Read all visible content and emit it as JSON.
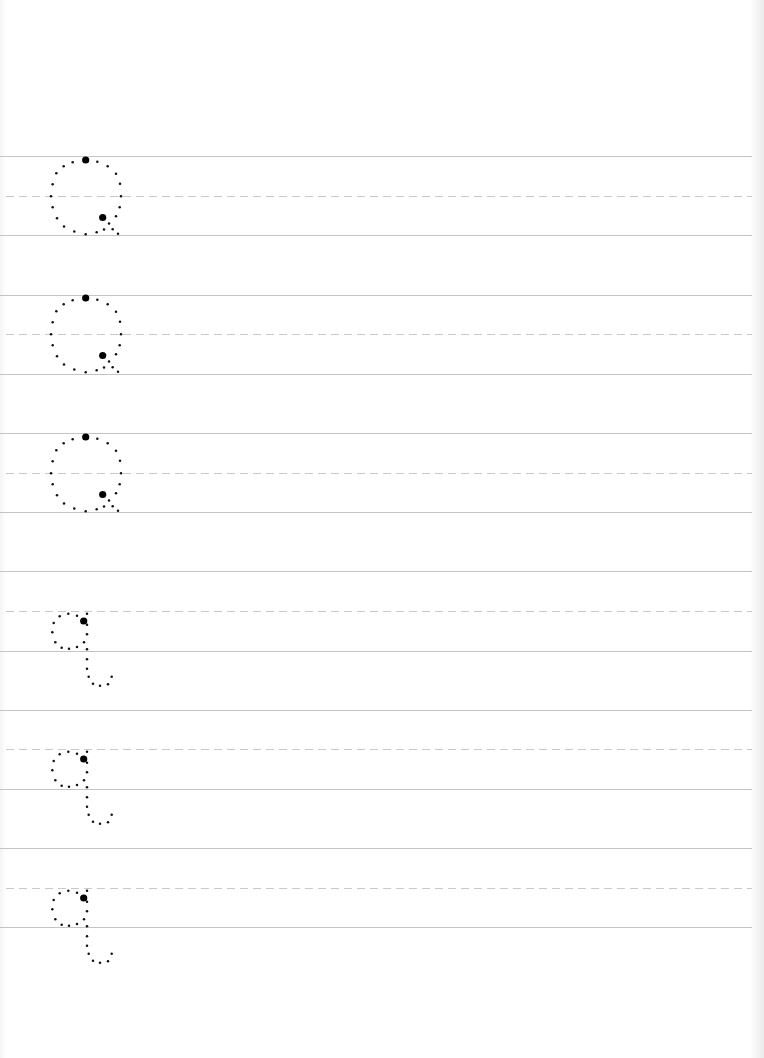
{
  "worksheet": {
    "type": "handwriting-tracing",
    "letter_upper": "Q",
    "letter_lower": "q",
    "colors": {
      "background": "#ffffff",
      "guide_line": "#c4c4c4",
      "midline_dashed": "#c9c9c9",
      "trace_dots": "#111111",
      "start_dot": "#000000"
    },
    "rows": [
      {
        "index": 1,
        "letter": "Q",
        "case": "upper",
        "top_y": 156,
        "mid_y": 196,
        "base_y": 235
      },
      {
        "index": 2,
        "letter": "Q",
        "case": "upper",
        "top_y": 295,
        "mid_y": 334,
        "base_y": 374
      },
      {
        "index": 3,
        "letter": "Q",
        "case": "upper",
        "top_y": 433,
        "mid_y": 473,
        "base_y": 512
      },
      {
        "index": 4,
        "letter": "q",
        "case": "lower",
        "top_y": 571,
        "mid_y": 611,
        "base_y": 651
      },
      {
        "index": 5,
        "letter": "q",
        "case": "lower",
        "top_y": 710,
        "mid_y": 749,
        "base_y": 789
      },
      {
        "index": 6,
        "letter": "q",
        "case": "lower",
        "top_y": 848,
        "mid_y": 888,
        "base_y": 927
      }
    ]
  }
}
